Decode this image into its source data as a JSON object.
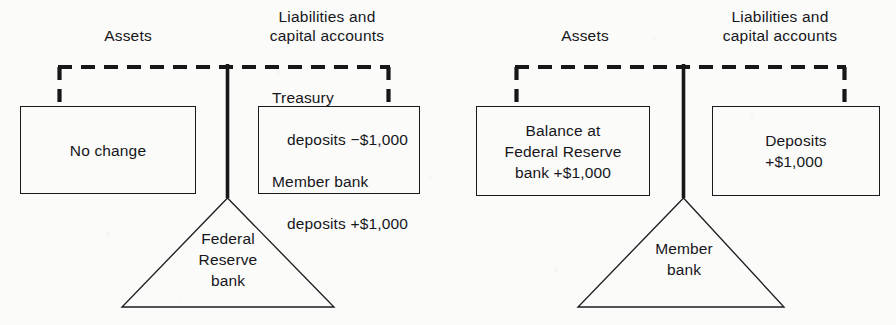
{
  "figure": {
    "kind": "t-account-balance-diagram",
    "background_color": "#fbfbfa",
    "ink_color": "#16161a"
  },
  "panels": [
    {
      "id": "federal-reserve-bank",
      "headers": {
        "assets": "Assets",
        "liabilities": "Liabilities and\ncapital accounts"
      },
      "assets_box": {
        "text": "No change",
        "align": "center"
      },
      "liabilities_box": {
        "lines": [
          {
            "text": "Treasury",
            "indent": false
          },
          {
            "text": "deposits −$1,000",
            "indent": true
          },
          {
            "text": "Member bank",
            "indent": false
          },
          {
            "text": "deposits +$1,000",
            "indent": true
          }
        ],
        "align": "left"
      },
      "entity_label": "Federal\nReserve\nbank"
    },
    {
      "id": "member-bank",
      "headers": {
        "assets": "Assets",
        "liabilities": "Liabilities and\ncapital accounts"
      },
      "assets_box": {
        "text": "Balance at\nFederal Reserve\nbank +$1,000",
        "align": "center"
      },
      "liabilities_box": {
        "text": "Deposits\n+$1,000",
        "align": "left"
      },
      "entity_label": "Member\nbank"
    }
  ]
}
